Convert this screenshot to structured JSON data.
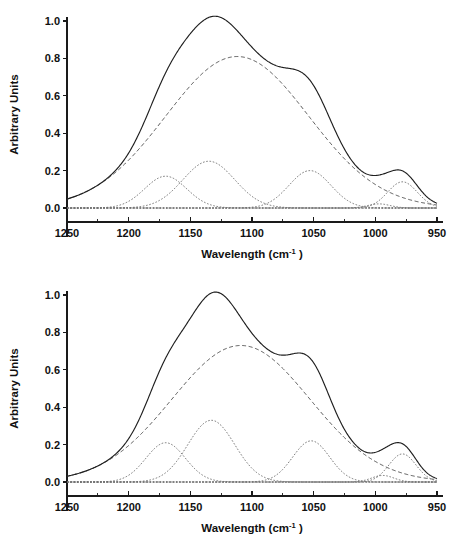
{
  "figure": {
    "title": "",
    "panel_count": 2
  },
  "chart_data": [
    {
      "id": "top",
      "type": "line",
      "title": "",
      "xlabel_text": "Wavelength (cm",
      "xlabel_sup": "-1",
      "xlabel_tail": ")",
      "ylabel": "Arbitrary Units",
      "xlim": [
        1250,
        950
      ],
      "ylim": [
        0.0,
        1.0
      ],
      "x_reversed": true,
      "grid": false,
      "legend": "none",
      "xticks": [
        1250,
        1200,
        1150,
        1100,
        1050,
        1000,
        950
      ],
      "xticklabels": [
        "1250",
        "1200",
        "1150",
        "1100",
        "1050",
        "1000",
        "950"
      ],
      "x_minor_ticks": [
        1225,
        1175,
        1125,
        1075,
        1025,
        975
      ],
      "yticks": [
        0.0,
        0.2,
        0.4,
        0.6,
        0.8,
        1.0
      ],
      "yticklabels": [
        "0.0",
        "0.2",
        "0.4",
        "0.6",
        "0.8",
        "1.0"
      ],
      "series": [
        {
          "name": "envelope",
          "style": "solid",
          "role": "sum-of-components",
          "peak_x": 1131,
          "peak_y": 1.0
        },
        {
          "name": "broad-component",
          "style": "dashed",
          "role": "main-broad-band",
          "center": 1112,
          "amplitude": 0.81,
          "width": 58
        },
        {
          "name": "component-1170",
          "style": "dotted",
          "center": 1170,
          "amplitude": 0.17,
          "width": 17
        },
        {
          "name": "component-1135",
          "style": "dotted",
          "center": 1135,
          "amplitude": 0.25,
          "width": 21
        },
        {
          "name": "component-1053",
          "style": "dotted",
          "center": 1053,
          "amplitude": 0.2,
          "width": 17
        },
        {
          "name": "component-978",
          "style": "dotted",
          "center": 978,
          "amplitude": 0.14,
          "width": 12
        },
        {
          "name": "component-997",
          "style": "dotted",
          "center": 997,
          "amplitude": 0.022,
          "width": 9
        },
        {
          "name": "baseline",
          "style": "dotted",
          "role": "zero-baseline",
          "amplitude": 0.0
        }
      ]
    },
    {
      "id": "bottom",
      "type": "line",
      "title": "",
      "xlabel_text": "Wavelength (cm",
      "xlabel_sup": "-1",
      "xlabel_tail": ")",
      "ylabel": "Arbitrary Units",
      "xlim": [
        1250,
        950
      ],
      "ylim": [
        0.0,
        1.0
      ],
      "x_reversed": true,
      "grid": false,
      "legend": "none",
      "xticks": [
        1250,
        1200,
        1150,
        1100,
        1050,
        1000,
        950
      ],
      "xticklabels": [
        "1250",
        "1200",
        "1150",
        "1100",
        "1050",
        "1000",
        "950"
      ],
      "x_minor_ticks": [
        1225,
        1175,
        1125,
        1075,
        1025,
        975
      ],
      "yticks": [
        0.0,
        0.2,
        0.4,
        0.6,
        0.8,
        1.0
      ],
      "yticklabels": [
        "0.0",
        "0.2",
        "0.4",
        "0.6",
        "0.8",
        "1.0"
      ],
      "series": [
        {
          "name": "envelope",
          "style": "solid",
          "role": "sum-of-components",
          "peak_x": 1132,
          "peak_y": 1.0
        },
        {
          "name": "broad-component",
          "style": "dashed",
          "role": "main-broad-band",
          "center": 1109,
          "amplitude": 0.73,
          "width": 56
        },
        {
          "name": "component-1170",
          "style": "dotted",
          "center": 1170,
          "amplitude": 0.21,
          "width": 16
        },
        {
          "name": "component-1133",
          "style": "dotted",
          "center": 1133,
          "amplitude": 0.33,
          "width": 19
        },
        {
          "name": "component-1053",
          "style": "dotted",
          "center": 1052,
          "amplitude": 0.22,
          "width": 15
        },
        {
          "name": "component-978",
          "style": "dotted",
          "center": 978,
          "amplitude": 0.15,
          "width": 11
        },
        {
          "name": "component-994",
          "style": "dotted",
          "center": 994,
          "amplitude": 0.035,
          "width": 9
        },
        {
          "name": "baseline",
          "style": "dotted",
          "role": "zero-baseline",
          "amplitude": 0.0
        }
      ]
    }
  ]
}
